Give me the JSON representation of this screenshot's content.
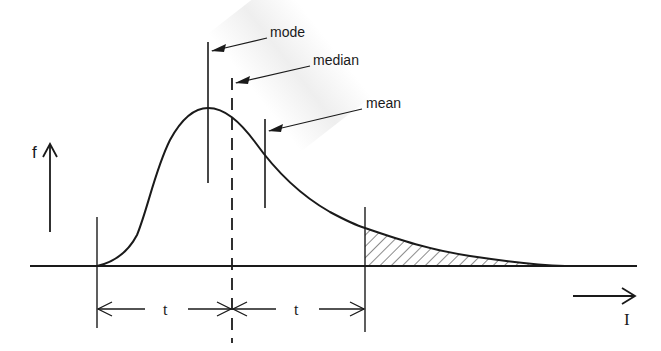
{
  "figure": {
    "type": "skewed-distribution-diagram",
    "y_axis_label": "f",
    "x_axis_label": "I",
    "annotations": [
      {
        "label": "mode",
        "meaning": "position of the peak of the distribution"
      },
      {
        "label": "median",
        "meaning": "dashed vertical line splitting the range into two intervals t"
      },
      {
        "label": "mean",
        "meaning": "vertical line right of the median"
      }
    ],
    "dimension_labels": [
      "t",
      "t"
    ],
    "shaded_region": "hatched right tail beyond distance t from the median",
    "colors": {
      "ink": "#1a1a1a",
      "background": "#ffffff"
    }
  },
  "labels": {
    "mode": "mode",
    "median": "median",
    "mean": "mean",
    "f": "f",
    "I": "I",
    "t_left": "t",
    "t_right": "t"
  }
}
